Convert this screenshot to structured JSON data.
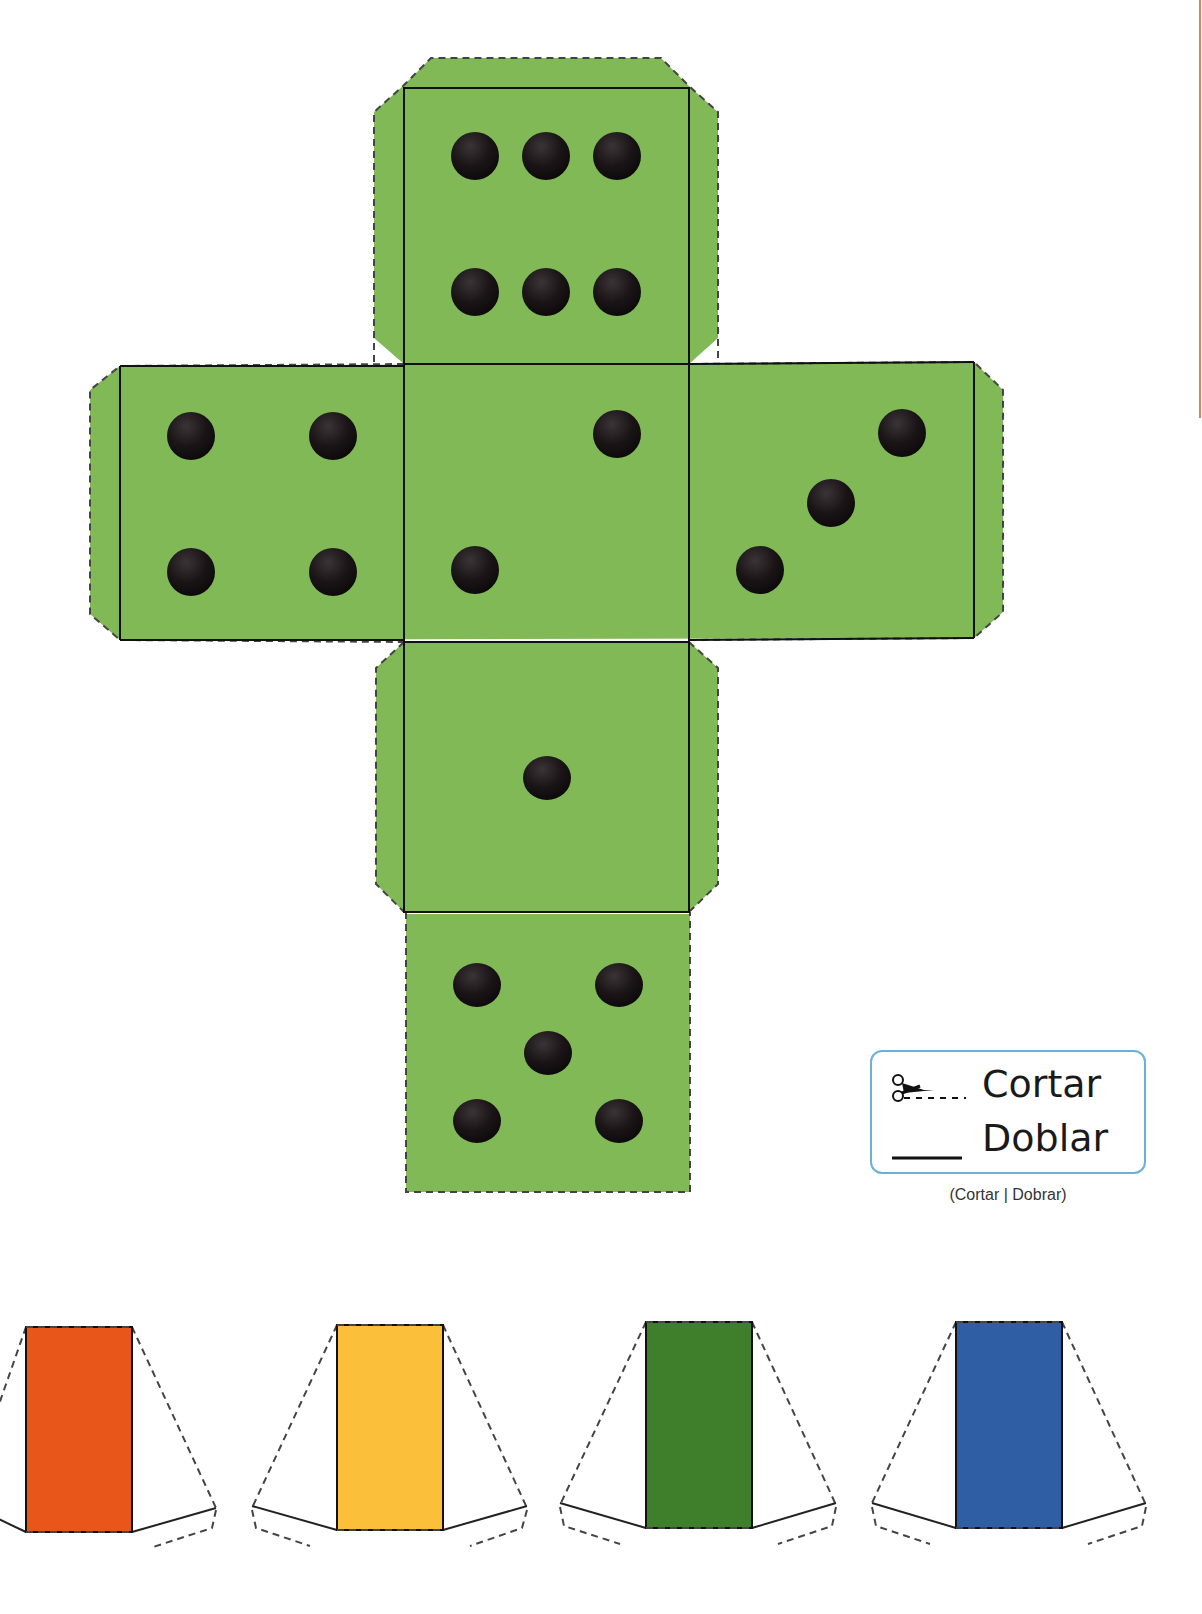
{
  "colors": {
    "die_green": "#80b956",
    "pip": "#1a1416",
    "fold_line": "#111111",
    "cut_line": "#444444",
    "legend_border": "#6ab0d8",
    "cone_colors": [
      "#e8561a",
      "#fbbf3a",
      "#3f7f2c",
      "#2f5ea5"
    ]
  },
  "die": {
    "faces": [
      {
        "name": "top",
        "pips": 6
      },
      {
        "name": "left",
        "pips": 4
      },
      {
        "name": "center",
        "pips": 2
      },
      {
        "name": "right",
        "pips": 3
      },
      {
        "name": "lower",
        "pips": 1
      },
      {
        "name": "bottom",
        "pips": 5
      }
    ]
  },
  "legend": {
    "cut_label": "Cortar",
    "fold_label": "Doblar",
    "cut_icon": "scissors-icon",
    "fold_icon": "solid-line-icon",
    "caption": "(Cortar | Dobrar)"
  },
  "cones": [
    {
      "color_name": "orange",
      "color": "#e8561a"
    },
    {
      "color_name": "yellow",
      "color": "#fbbf3a"
    },
    {
      "color_name": "green",
      "color": "#3f7f2c"
    },
    {
      "color_name": "blue",
      "color": "#2f5ea5"
    }
  ]
}
